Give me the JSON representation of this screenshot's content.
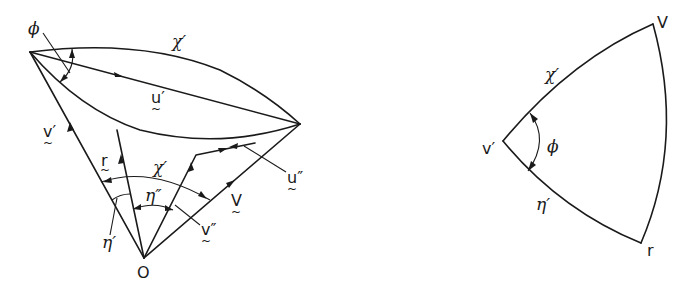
{
  "figure": {
    "left_diagram": {
      "labels": {
        "phi": "ϕ",
        "chi_prime_top": "χ′",
        "u_prime": "u′",
        "v_prime": "v′",
        "r": "r",
        "chi_prime_inner": "χ′",
        "eta_double_prime": "η″",
        "eta_prime": "η′",
        "v_double_prime": "v″",
        "V": "V",
        "u_double_prime": "u″",
        "origin": "O",
        "tilde": "~"
      }
    },
    "right_diagram": {
      "labels": {
        "V": "V",
        "chi_prime": "χ′",
        "v_prime": "v′",
        "phi": "ϕ",
        "eta_prime": "η′",
        "r": "r"
      }
    },
    "colors": {
      "ink": "#1a1a1a",
      "background": "#ffffff"
    }
  }
}
